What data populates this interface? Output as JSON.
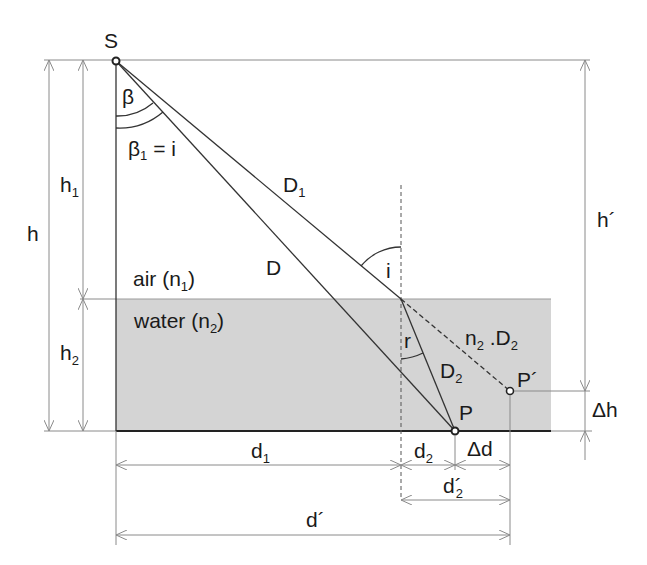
{
  "diagram": {
    "colors": {
      "background": "#ffffff",
      "water_fill": "#d4d4d4",
      "ray_stroke": "#333333",
      "dimension_stroke": "#8a8a8a"
    },
    "media": {
      "air": {
        "label": "air (",
        "sym": "n",
        "sub": "1",
        "close": ")"
      },
      "water": {
        "label": "water (",
        "sym": "n",
        "sub": "2",
        "close": ")"
      }
    },
    "points": {
      "source": "S",
      "target": "P",
      "apparent": "P´"
    },
    "angles": {
      "beta": "β",
      "beta1": {
        "sym": "β",
        "sub": "1",
        "rest": " = i"
      },
      "incidence": "i",
      "refraction": "r"
    },
    "segments": {
      "D": "D",
      "D1": {
        "sym": "D",
        "sub": "1"
      },
      "D2": {
        "sym": "D",
        "sub": "2"
      },
      "n2D2": {
        "sym1": "n",
        "sub1": "2",
        "mid": " .D",
        "sub2": "2"
      }
    },
    "dimensions": {
      "h": "h",
      "h1": {
        "sym": "h",
        "sub": "1"
      },
      "h2": {
        "sym": "h",
        "sub": "2"
      },
      "h_prime": "h´",
      "delta_h": "Δh",
      "d1": {
        "sym": "d",
        "sub": "1"
      },
      "d2": {
        "sym": "d",
        "sub": "2"
      },
      "delta_d": "Δd",
      "d2_prime": {
        "sym": "d´",
        "sub": "2"
      },
      "d_prime": "d´"
    }
  }
}
